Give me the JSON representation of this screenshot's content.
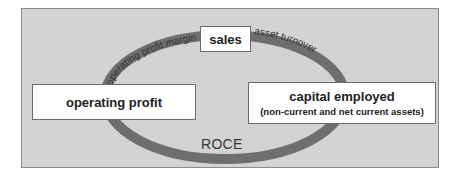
{
  "diagram": {
    "nodes": {
      "sales": "sales",
      "operating_profit": "operating profit",
      "capital_employed": {
        "title": "capital employed",
        "subtitle": "(non-current and net current assets)"
      }
    },
    "arc_labels": {
      "operating_profit_margin": "operating profit margin",
      "asset_turnover": "asset turnover",
      "roce": "ROCE"
    },
    "colors": {
      "background": "#d3d3d3",
      "ring": "#6e6e6e",
      "box_fill": "#ffffff"
    }
  }
}
